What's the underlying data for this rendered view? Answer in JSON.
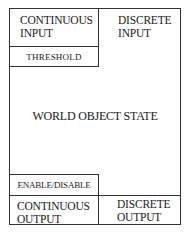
{
  "diagram": {
    "top_left": {
      "line1": "CONTINUOUS",
      "line2": "INPUT"
    },
    "top_right": {
      "line1": "DISCRETE",
      "line2": "INPUT"
    },
    "threshold": "THRESHOLD",
    "center": "WORLD OBJECT STATE",
    "enable_disable": "ENABLE/DISABLE",
    "bottom_left": {
      "line1": "CONTINUOUS",
      "line2": "OUTPUT"
    },
    "bottom_right": {
      "line1": "DISCRETE",
      "line2": "OUTPUT"
    }
  }
}
